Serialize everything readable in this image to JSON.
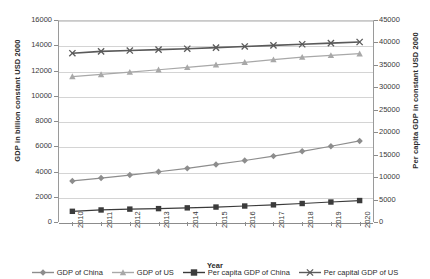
{
  "chart_data": {
    "type": "line",
    "title": "",
    "xlabel": "Year",
    "ylabel": "GDP in billion constant USD 2000",
    "y2label": "Per capita GDP in constant USD 2000",
    "categories": [
      "2010",
      "2011",
      "2012",
      "2013",
      "2014",
      "2015",
      "2016",
      "2017",
      "2018",
      "2019",
      "2020"
    ],
    "ylim": [
      0,
      16000
    ],
    "yticks": [
      0,
      2000,
      4000,
      6000,
      8000,
      10000,
      12000,
      14000,
      16000
    ],
    "y2lim": [
      0,
      45000
    ],
    "y2ticks": [
      0,
      5000,
      10000,
      15000,
      20000,
      25000,
      30000,
      35000,
      40000,
      45000
    ],
    "grid": true,
    "legend_position": "bottom",
    "series": [
      {
        "name": "GDP of China",
        "axis": "left",
        "marker": "diamond",
        "color": "#8d8d8d",
        "values": [
          3250,
          3480,
          3720,
          3980,
          4250,
          4560,
          4870,
          5220,
          5600,
          6000,
          6420
        ]
      },
      {
        "name": "GDP of US",
        "axis": "left",
        "marker": "triangle",
        "color": "#a8a8a8",
        "values": [
          11520,
          11690,
          11870,
          12060,
          12250,
          12450,
          12650,
          12860,
          13060,
          13200,
          13330
        ]
      },
      {
        "name": "Per capita GDP of China",
        "axis": "right",
        "marker": "square",
        "color": "#3b3b3b",
        "values": [
          2380,
          2680,
          2870,
          2980,
          3150,
          3330,
          3560,
          3820,
          4120,
          4450,
          4780
        ]
      },
      {
        "name": "Per capital GDP of US",
        "axis": "right",
        "marker": "cross",
        "color": "#5a5a5a",
        "values": [
          37600,
          38000,
          38200,
          38400,
          38600,
          38850,
          39100,
          39350,
          39600,
          39850,
          40100
        ]
      }
    ]
  },
  "legend": {
    "items": [
      {
        "label": "GDP of China"
      },
      {
        "label": "GDP of US"
      },
      {
        "label": "Per capita GDP of China"
      },
      {
        "label": "Per capital GDP of US"
      }
    ]
  }
}
